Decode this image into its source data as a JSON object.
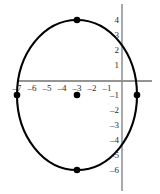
{
  "chart_data": {
    "type": "scatter",
    "title": "",
    "xlabel": "",
    "ylabel": "",
    "xlim": [
      -7.8,
      1.7
    ],
    "ylim": [
      -6.9,
      5.0
    ],
    "grid": false,
    "legend": null,
    "shape": {
      "kind": "ellipse",
      "center": [
        -3,
        -1
      ],
      "semi_axis_x": 4,
      "semi_axis_y": 5,
      "stroke": "#000000",
      "stroke_width": 2.1,
      "fill": "none"
    },
    "points": [
      {
        "label": "center",
        "x": -3,
        "y": -1
      },
      {
        "label": "top-vertex",
        "x": -3,
        "y": 4
      },
      {
        "label": "bottom-vertex",
        "x": -3,
        "y": -6
      },
      {
        "label": "left-vertex",
        "x": -7,
        "y": -1
      },
      {
        "label": "right-vertex",
        "x": 1,
        "y": -1
      }
    ],
    "x_ticks": [
      -7,
      -6,
      -5,
      -4,
      -3,
      -2,
      -1
    ],
    "x_tick_labels": [
      "–7",
      "–6",
      "–5",
      "–4",
      "–3",
      "–2",
      "–1"
    ],
    "y_ticks": [
      4,
      3,
      2,
      1,
      -1,
      -2,
      -3,
      -4,
      -5,
      -6
    ],
    "y_tick_labels": [
      "4",
      "3",
      "2",
      "1",
      "–1",
      "–2",
      "–3",
      "–4",
      "–5",
      "–6"
    ],
    "axes": {
      "x_axis_color": "#2b2b2b",
      "y_axis_color": "#8c8c8c"
    }
  },
  "colors": {
    "curve": "#000000",
    "point": "#000000",
    "x_axis": "#2b2b2b",
    "y_axis": "#8c8c8c",
    "label": "#2b2b2b",
    "background": "#ffffff"
  }
}
